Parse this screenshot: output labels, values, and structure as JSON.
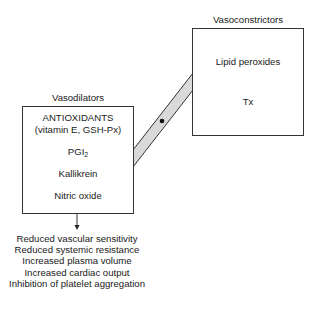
{
  "diagram": {
    "vasoconstrictors": {
      "title": "Vasoconstrictors",
      "items": [
        "Lipid peroxides",
        "Tx"
      ]
    },
    "vasodilators": {
      "title": "Vasodilators",
      "items": {
        "antioxidants": "ANTIOXIDANTS",
        "antioxidants_detail": "(vitamin E, GSH-Px)",
        "pgi_base": "PGI",
        "pgi_sub": "2",
        "kallikrein": "Kallikrein",
        "nitric_oxide": "Nitric oxide"
      }
    },
    "balance_connector": {
      "fill": "#d9d9d9",
      "pivot": "dot"
    },
    "effects": [
      "Reduced vascular sensitivity",
      "Reduced systemic resistance",
      "Increased plasma volume",
      "Increased cardiac output",
      "Inhibition of platelet aggregation"
    ]
  }
}
